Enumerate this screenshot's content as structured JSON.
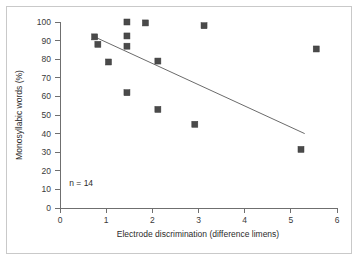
{
  "chart_data": {
    "type": "scatter",
    "title": "",
    "xlabel": "Electrode discrimination (difference limens)",
    "ylabel": "Monosyllabic words (%)",
    "xlim": [
      0,
      6
    ],
    "ylim": [
      0,
      100
    ],
    "xticks": [
      0,
      1,
      2,
      3,
      4,
      5,
      6
    ],
    "yticks": [
      0,
      10,
      20,
      30,
      40,
      50,
      60,
      70,
      80,
      90,
      100
    ],
    "xtick_labels": [
      "0",
      "1",
      "2",
      "3",
      "4",
      "5",
      "6"
    ],
    "ytick_labels": [
      "0",
      "10",
      "20",
      "30",
      "40",
      "50",
      "60",
      "70",
      "80",
      "90",
      "100"
    ],
    "grid": false,
    "legend": "none",
    "annotations": [
      {
        "text": "n = 14",
        "x": 0.2,
        "y": 12
      }
    ],
    "marker": {
      "shape": "square",
      "size_px": 6,
      "color": "#4a4a4a",
      "edge_color": "#3a3a3a"
    },
    "points": [
      {
        "x": 0.75,
        "y": 92.0
      },
      {
        "x": 0.82,
        "y": 88.0
      },
      {
        "x": 1.05,
        "y": 78.5
      },
      {
        "x": 1.45,
        "y": 100.0
      },
      {
        "x": 1.45,
        "y": 92.5
      },
      {
        "x": 1.45,
        "y": 87.0
      },
      {
        "x": 1.45,
        "y": 62.0
      },
      {
        "x": 1.85,
        "y": 99.5
      },
      {
        "x": 2.12,
        "y": 79.0
      },
      {
        "x": 2.12,
        "y": 53.0
      },
      {
        "x": 2.92,
        "y": 45.0
      },
      {
        "x": 3.12,
        "y": 98.0
      },
      {
        "x": 5.22,
        "y": 31.5
      },
      {
        "x": 5.55,
        "y": 85.5
      }
    ],
    "series": [
      {
        "name": "Monosyllabic word score vs electrode discrimination",
        "type": "scatter",
        "n": 14,
        "color": "#4a4a4a"
      },
      {
        "name": "regression-line",
        "type": "line",
        "color": "#6b6b6b",
        "x": [
          0.75,
          5.3
        ],
        "y": [
          92.0,
          40.0
        ]
      }
    ]
  },
  "figure": {
    "frame_color": "#c9c9c9",
    "background": "#ffffff",
    "axis_color": "#6f6f6f",
    "text_color": "#2b2b2b"
  }
}
